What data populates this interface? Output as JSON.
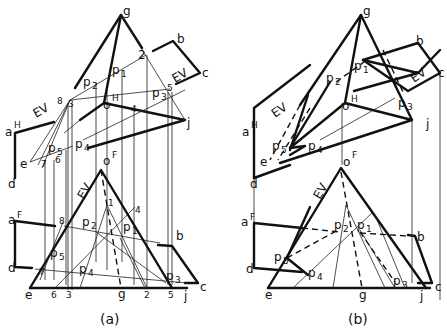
{
  "figure": {
    "panels": [
      {
        "caption": "(a)",
        "top_view": {
          "vertices": [
            "g",
            "o",
            "j",
            "e"
          ],
          "plane_vertices": [
            "a",
            "b",
            "c",
            "d"
          ],
          "superscripts": {
            "a": "H",
            "o": "H"
          },
          "true_size_label": "EV",
          "cut_points": [
            "p1",
            "p2",
            "p3",
            "p4",
            "p5"
          ],
          "numbered_points": [
            "1",
            "2",
            "3",
            "4",
            "5",
            "6",
            "7",
            "8"
          ]
        },
        "front_view": {
          "vertices": [
            "o",
            "e",
            "g",
            "j"
          ],
          "plane_vertices": [
            "a",
            "b",
            "c",
            "d"
          ],
          "superscripts": {
            "a": "F",
            "o": "F"
          },
          "true_size_label": "EV",
          "cut_points": [
            "p1",
            "p2",
            "p3",
            "p4",
            "p5"
          ],
          "numbered_points": [
            "1",
            "2",
            "3",
            "4",
            "5",
            "6",
            "7",
            "8"
          ],
          "baseline_labels": [
            "e",
            "6",
            "3",
            "g",
            "2",
            "5",
            "j"
          ]
        }
      },
      {
        "caption": "(b)",
        "top_view": {
          "vertices": [
            "g",
            "o",
            "j",
            "e"
          ],
          "plane_vertices": [
            "a",
            "b",
            "c",
            "d"
          ],
          "superscripts": {
            "a": "H",
            "o": "H"
          },
          "true_size_label": "EV",
          "cut_points": [
            "p1",
            "p2",
            "p3",
            "p4",
            "p5"
          ]
        },
        "front_view": {
          "vertices": [
            "o",
            "e",
            "g",
            "j"
          ],
          "plane_vertices": [
            "a",
            "b",
            "c",
            "d"
          ],
          "superscripts": {
            "a": "F",
            "o": "F"
          },
          "true_size_label": "EV",
          "cut_points": [
            "p1",
            "p2",
            "p3",
            "p4",
            "p5"
          ],
          "baseline_labels": [
            "e",
            "g",
            "j"
          ]
        }
      }
    ],
    "labels": {
      "g": "g",
      "o": "o",
      "j": "j",
      "e": "e",
      "a": "a",
      "b": "b",
      "c": "c",
      "d": "d",
      "H": "H",
      "F": "F",
      "EV": "EV",
      "p": "p",
      "n1": "1",
      "n2": "2",
      "n3": "3",
      "n4": "4",
      "n5": "5",
      "n6": "6",
      "n7": "7",
      "n8": "8",
      "caption_a": "(a)",
      "caption_b": "(b)"
    }
  }
}
